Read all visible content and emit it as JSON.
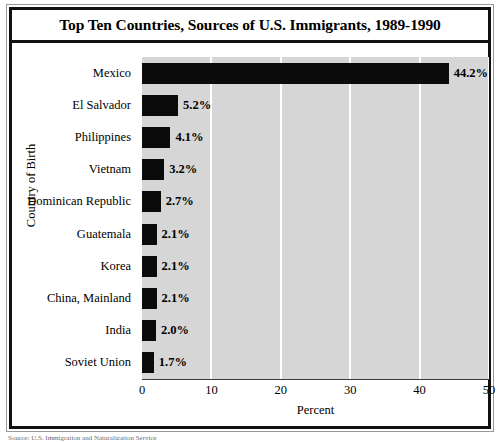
{
  "figure": {
    "title": "Top Ten Countries, Sources of U.S. Immigrants, 1989-1990",
    "source_note": "Source: U.S. Immigration and Naturalization Service"
  },
  "chart_data": {
    "type": "bar",
    "orientation": "horizontal",
    "title": "Top Ten Countries, Sources of U.S. Immigrants, 1989-1990",
    "xlabel": "Percent",
    "ylabel": "Country of Birth",
    "categories": [
      "Mexico",
      "El Salvador",
      "Philippines",
      "Vietnam",
      "Dominican Republic",
      "Guatemala",
      "Korea",
      "China, Mainland",
      "India",
      "Soviet Union"
    ],
    "values": [
      44.2,
      5.2,
      4.1,
      3.2,
      2.7,
      2.1,
      2.1,
      2.1,
      2.0,
      1.7
    ],
    "value_labels": [
      "44.2%",
      "5.2%",
      "4.1%",
      "3.2%",
      "2.7%",
      "2.1%",
      "2.1%",
      "2.1%",
      "2.0%",
      "1.7%"
    ],
    "xlim": [
      0,
      50
    ],
    "xticks": [
      0,
      10,
      20,
      30,
      40,
      50
    ],
    "xtick_labels": [
      "0",
      "10",
      "20",
      "30",
      "40",
      "50"
    ],
    "grid": "vertical-white-gridlines",
    "legend": "none",
    "colors": {
      "bar": "#0b0b0b",
      "plot_background": "#d6d6d6",
      "gridline": "#ffffff",
      "frame": "#111111",
      "text": "#000000"
    }
  }
}
